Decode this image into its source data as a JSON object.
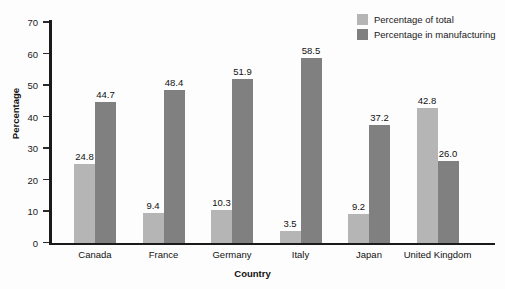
{
  "chart_data": {
    "type": "bar",
    "title": "",
    "xlabel": "Country",
    "ylabel": "Percentage",
    "categories": [
      "Canada",
      "France",
      "Germany",
      "Italy",
      "Japan",
      "United Kingdom"
    ],
    "series": [
      {
        "name": "Percentage of total",
        "color": "#b5b5b5",
        "values": [
          24.8,
          9.4,
          10.3,
          3.5,
          9.2,
          42.8
        ],
        "labels": [
          "24.8",
          "9.4",
          "10.3",
          "3.5",
          "9.2",
          "42.8"
        ]
      },
      {
        "name": "Percentage in manufacturing",
        "color": "#808080",
        "values": [
          44.7,
          48.4,
          51.9,
          58.5,
          37.2,
          26.0
        ],
        "labels": [
          "44.7",
          "48.4",
          "51.9",
          "58.5",
          "37.2",
          "26.0"
        ]
      }
    ],
    "ylim": [
      0,
      70
    ],
    "yticks": [
      0,
      10,
      20,
      30,
      40,
      50,
      60,
      70
    ],
    "ytick_labels": [
      "0",
      "10",
      "20",
      "30",
      "40",
      "50",
      "60",
      "70"
    ],
    "grid": false,
    "legend_position": "top-right"
  },
  "legend": {
    "items": [
      {
        "label": "Percentage of total",
        "color": "#b5b5b5"
      },
      {
        "label": "Percentage in manufacturing",
        "color": "#808080"
      }
    ]
  },
  "axes": {
    "y_title": "Percentage",
    "x_title": "Country"
  }
}
